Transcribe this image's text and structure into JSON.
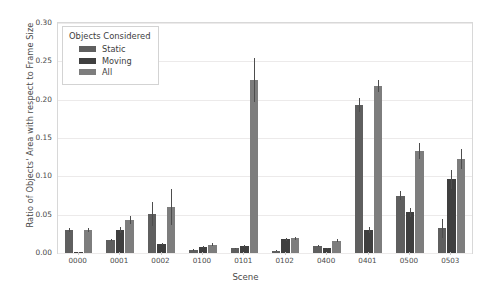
{
  "chart_data": {
    "type": "bar",
    "title": "",
    "xlabel": "Scene",
    "ylabel": "Ratio of Objects' Area with respect to Frame Size",
    "categories": [
      "0000",
      "0001",
      "0002",
      "0100",
      "0101",
      "0102",
      "0400",
      "0401",
      "0500",
      "0503"
    ],
    "ylim": [
      0.0,
      0.3
    ],
    "yticks": [
      "0.00",
      "0.05",
      "0.10",
      "0.15",
      "0.20",
      "0.25",
      "0.30"
    ],
    "ytick_values": [
      0.0,
      0.05,
      0.1,
      0.15,
      0.2,
      0.25,
      0.3
    ],
    "grid": true,
    "legend_position": "upper left",
    "legend_title": "Objects Considered",
    "series": [
      {
        "name": "Static",
        "color": "#5f5f5f",
        "values": [
          0.03,
          0.017,
          0.051,
          0.004,
          0.006,
          0.003,
          0.009,
          0.193,
          0.075,
          0.032
        ],
        "errors": [
          0.002,
          0.001,
          0.016,
          0.001,
          0.001,
          0.001,
          0.001,
          0.009,
          0.006,
          0.012
        ]
      },
      {
        "name": "Moving",
        "color": "#3f3f3f",
        "values": [
          0.0005,
          0.03,
          0.012,
          0.008,
          0.009,
          0.018,
          0.006,
          0.03,
          0.053,
          0.096
        ],
        "errors": [
          0.0003,
          0.004,
          0.001,
          0.001,
          0.001,
          0.002,
          0.001,
          0.004,
          0.006,
          0.012
        ]
      },
      {
        "name": "All",
        "color": "#7d7d7d",
        "values": [
          0.03,
          0.043,
          0.06,
          0.011,
          0.226,
          0.019,
          0.016,
          0.218,
          0.133,
          0.123
        ],
        "errors": [
          0.002,
          0.005,
          0.023,
          0.002,
          0.029,
          0.002,
          0.002,
          0.008,
          0.011,
          0.013
        ]
      }
    ]
  }
}
